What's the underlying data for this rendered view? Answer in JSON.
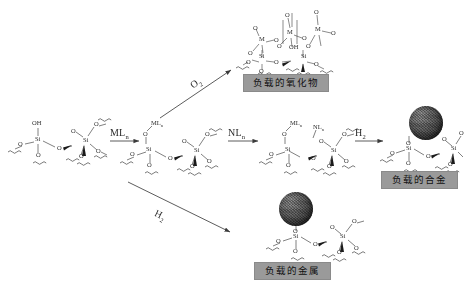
{
  "diagram": {
    "type": "reaction-scheme",
    "title_visible": false,
    "background_color": "#ffffff",
    "caption_box_color": "#9a9a9a"
  },
  "reagents": {
    "o2": "O",
    "o2_sub": "2",
    "ml_n": "ML",
    "ml_n_sub": "n",
    "nl_n": "NL",
    "nl_n_sub": "n",
    "h2_right": "H",
    "h2_right_sub": "2",
    "h2_bottom": "H",
    "h2_bottom_sub": "2"
  },
  "captions": {
    "oxide": "负载的氧化物",
    "metal": "负载的金属",
    "alloy": "负载的合金"
  },
  "atoms": {
    "oh": "OH",
    "o": "O",
    "si": "Si",
    "m": "M",
    "n": "N"
  },
  "structures": [
    {
      "id": "silica-surface",
      "name": "silanol-silica-support",
      "labels": [
        "OH",
        "O",
        "Si",
        "O",
        "O",
        "O",
        "Si",
        "O",
        "O"
      ]
    },
    {
      "id": "grafted-metal",
      "name": "grafted-metal-complex",
      "labels": [
        "ML",
        "O",
        "Si",
        "O",
        "O",
        "Si",
        "O",
        "O"
      ]
    },
    {
      "id": "grafted-bimetal",
      "name": "grafted-bimetallic-complex",
      "labels": [
        "ML",
        "NL",
        "O",
        "Si",
        "O",
        "O",
        "Si",
        "O",
        "O"
      ]
    },
    {
      "id": "supported-oxide",
      "name": "supported-oxide-structure",
      "labels": [
        "O",
        "M",
        "O",
        "O",
        "M",
        "O",
        "O",
        "M",
        "O",
        "OH",
        "Si",
        "O",
        "Si",
        "O",
        "O"
      ]
    },
    {
      "id": "supported-metal-np",
      "name": "supported-metal-nanoparticle",
      "labels": [
        "O",
        "Si",
        "O",
        "O",
        "Si",
        "O",
        "O"
      ]
    },
    {
      "id": "supported-alloy-np",
      "name": "supported-alloy-nanoparticle",
      "labels": [
        "O",
        "Si",
        "O",
        "O",
        "Si",
        "O",
        "O"
      ]
    }
  ]
}
